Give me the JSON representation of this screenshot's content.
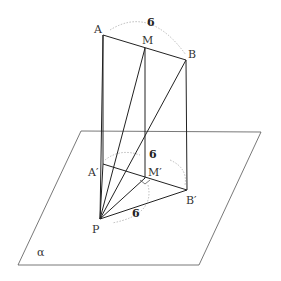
{
  "figure": {
    "type": "3d-geometry",
    "plane_label": "α",
    "points": {
      "A": {
        "label": "A",
        "x": 103,
        "y": 35
      },
      "M": {
        "label": "M",
        "x": 145,
        "y": 48
      },
      "B": {
        "label": "B",
        "x": 186,
        "y": 60
      },
      "A_prime": {
        "label": "A′",
        "x": 103,
        "y": 164
      },
      "M_prime": {
        "label": "M′",
        "x": 145,
        "y": 178
      },
      "B_prime": {
        "label": "B′",
        "x": 187,
        "y": 190
      },
      "P": {
        "label": "P",
        "x": 100,
        "y": 219
      }
    },
    "lengths": {
      "AB": "6",
      "MM_prime": "6",
      "PB_prime": "6"
    },
    "plane": {
      "corners": [
        [
          81,
          131
        ],
        [
          261,
          132
        ],
        [
          199,
          265
        ],
        [
          18,
          265
        ]
      ]
    }
  }
}
